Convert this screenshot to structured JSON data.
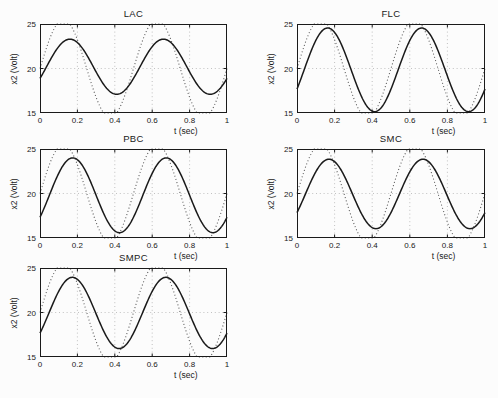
{
  "figure": {
    "background": "#fcfcfc",
    "response_color": "#1a1a1a",
    "reference_color": "#5a5a5a",
    "grid_color": "#a8a8a8",
    "axis_color": "#1a1a1a"
  },
  "chart_data": [
    {
      "type": "line",
      "title": "LAC",
      "xlabel": "t (sec)",
      "ylabel": "x2 (Volt)",
      "xlim": [
        0,
        1
      ],
      "ylim": [
        15,
        25
      ],
      "xticks": [
        0,
        0.2,
        0.4,
        0.6,
        0.8,
        1
      ],
      "xtick_labels": [
        "0",
        "0.2",
        "0.4",
        "0.6",
        "0.8",
        "1"
      ],
      "yticks": [
        15,
        20,
        25
      ],
      "ytick_labels": [
        "15",
        "20",
        "25"
      ],
      "grid": true,
      "series": [
        {
          "name": "reference",
          "style": "dotted",
          "model": "sine",
          "mean": 20,
          "amp": 5.5,
          "freq_hz": 2,
          "t0": 0,
          "clip": [
            15,
            25
          ]
        },
        {
          "name": "response",
          "style": "solid",
          "model": "sine",
          "mean": 20.2,
          "amp": 3.1,
          "freq_hz": 2,
          "t0": 0.035,
          "clip": [
            15,
            25
          ]
        }
      ]
    },
    {
      "type": "line",
      "title": "FLC",
      "xlabel": "t (sec)",
      "ylabel": "x2 (Volt)",
      "xlim": [
        0,
        1
      ],
      "ylim": [
        15,
        25
      ],
      "xticks": [
        0,
        0.2,
        0.4,
        0.6,
        0.8,
        1
      ],
      "xtick_labels": [
        "0",
        "0.2",
        "0.4",
        "0.6",
        "0.8",
        "1"
      ],
      "yticks": [
        15,
        20,
        25
      ],
      "ytick_labels": [
        "15",
        "20",
        "25"
      ],
      "grid": true,
      "series": [
        {
          "name": "reference",
          "style": "dotted",
          "model": "sine",
          "mean": 20,
          "amp": 5.5,
          "freq_hz": 2,
          "t0": 0,
          "clip": [
            15,
            25
          ]
        },
        {
          "name": "response",
          "style": "solid",
          "model": "sine",
          "mean": 19.85,
          "amp": 4.7,
          "freq_hz": 2,
          "t0": 0.038,
          "clip": [
            15,
            25
          ]
        }
      ]
    },
    {
      "type": "line",
      "title": "PBC",
      "xlabel": "t (sec)",
      "ylabel": "x2 (Volt)",
      "xlim": [
        0,
        1
      ],
      "ylim": [
        15,
        25
      ],
      "xticks": [
        0,
        0.2,
        0.4,
        0.6,
        0.8,
        1
      ],
      "xtick_labels": [
        "0",
        "0.2",
        "0.4",
        "0.6",
        "0.8",
        "1"
      ],
      "yticks": [
        15,
        20,
        25
      ],
      "ytick_labels": [
        "15",
        "20",
        "25"
      ],
      "grid": true,
      "series": [
        {
          "name": "reference",
          "style": "dotted",
          "model": "sine",
          "mean": 20,
          "amp": 5.5,
          "freq_hz": 2,
          "t0": 0,
          "clip": [
            15,
            25
          ]
        },
        {
          "name": "response",
          "style": "solid",
          "model": "sine",
          "mean": 19.8,
          "amp": 4.2,
          "freq_hz": 2,
          "t0": 0.05,
          "clip": [
            15,
            25
          ]
        }
      ]
    },
    {
      "type": "line",
      "title": "SMC",
      "xlabel": "t (sec)",
      "ylabel": "x2 (Volt)",
      "xlim": [
        0,
        1
      ],
      "ylim": [
        15,
        25
      ],
      "xticks": [
        0,
        0.2,
        0.4,
        0.6,
        0.8,
        1
      ],
      "xtick_labels": [
        "0",
        "0.2",
        "0.4",
        "0.6",
        "0.8",
        "1"
      ],
      "yticks": [
        15,
        20,
        25
      ],
      "ytick_labels": [
        "15",
        "20",
        "25"
      ],
      "grid": true,
      "series": [
        {
          "name": "reference",
          "style": "dotted",
          "model": "sine",
          "mean": 20,
          "amp": 5.5,
          "freq_hz": 2,
          "t0": 0,
          "clip": [
            15,
            25
          ]
        },
        {
          "name": "response",
          "style": "solid",
          "model": "sine",
          "mean": 19.95,
          "amp": 3.9,
          "freq_hz": 2,
          "t0": 0.045,
          "clip": [
            15,
            25
          ]
        }
      ]
    },
    {
      "type": "line",
      "title": "SMPC",
      "xlabel": "t (sec)",
      "ylabel": "x2 (Volt)",
      "xlim": [
        0,
        1
      ],
      "ylim": [
        15,
        25
      ],
      "xticks": [
        0,
        0.2,
        0.4,
        0.6,
        0.8,
        1
      ],
      "xtick_labels": [
        "0",
        "0.2",
        "0.4",
        "0.6",
        "0.8",
        "1"
      ],
      "yticks": [
        15,
        20,
        25
      ],
      "ytick_labels": [
        "15",
        "20",
        "25"
      ],
      "grid": true,
      "series": [
        {
          "name": "reference",
          "style": "dotted",
          "model": "sine",
          "mean": 20,
          "amp": 5.5,
          "freq_hz": 2,
          "t0": 0,
          "clip": [
            15,
            25
          ]
        },
        {
          "name": "response",
          "style": "solid",
          "model": "sine",
          "mean": 19.95,
          "amp": 4.0,
          "freq_hz": 2,
          "t0": 0.048,
          "clip": [
            15,
            25
          ]
        }
      ]
    }
  ]
}
